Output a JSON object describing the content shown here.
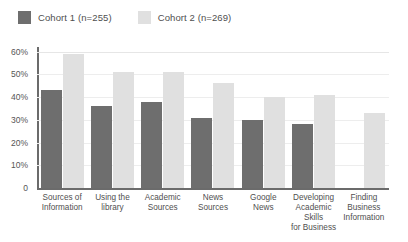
{
  "chart_data": {
    "type": "bar",
    "title": "",
    "subtitle": "",
    "xlabel": "",
    "ylabel": "",
    "ylim": [
      0,
      62
    ],
    "grid": true,
    "legend_position": "top-left",
    "ytick_labels": [
      "60%",
      "50%",
      "40%",
      "30%",
      "20%",
      "10%",
      "0"
    ],
    "ytick_values": [
      60,
      50,
      40,
      30,
      20,
      10,
      0
    ],
    "categories": [
      "Sources of Information",
      "Using the library",
      "Academic Sources",
      "News Sources",
      "Google News",
      "Developing Academic Skills for Business",
      "Finding Business Information"
    ],
    "category_lines": [
      [
        "Sources of",
        "Information"
      ],
      [
        "Using the",
        "library"
      ],
      [
        "Academic",
        "Sources"
      ],
      [
        "News",
        "Sources"
      ],
      [
        "Google",
        "News"
      ],
      [
        "Developing",
        "Academic Skills",
        "for Business"
      ],
      [
        "Finding",
        "Business",
        "Information"
      ]
    ],
    "series": [
      {
        "name": "Cohort 1 (n=255)",
        "color": "#6e6e6e",
        "values": [
          43,
          36,
          38,
          31,
          30,
          28,
          null
        ]
      },
      {
        "name": "Cohort 2 (n=269)",
        "color": "#e0e0e0",
        "values": [
          59,
          51,
          51,
          46,
          40,
          41,
          33
        ]
      }
    ]
  },
  "legend": {
    "items": [
      {
        "label": "Cohort 1 (n=255)",
        "color": "#6e6e6e"
      },
      {
        "label": "Cohort 2 (n=269)",
        "color": "#e0e0e0"
      }
    ]
  }
}
